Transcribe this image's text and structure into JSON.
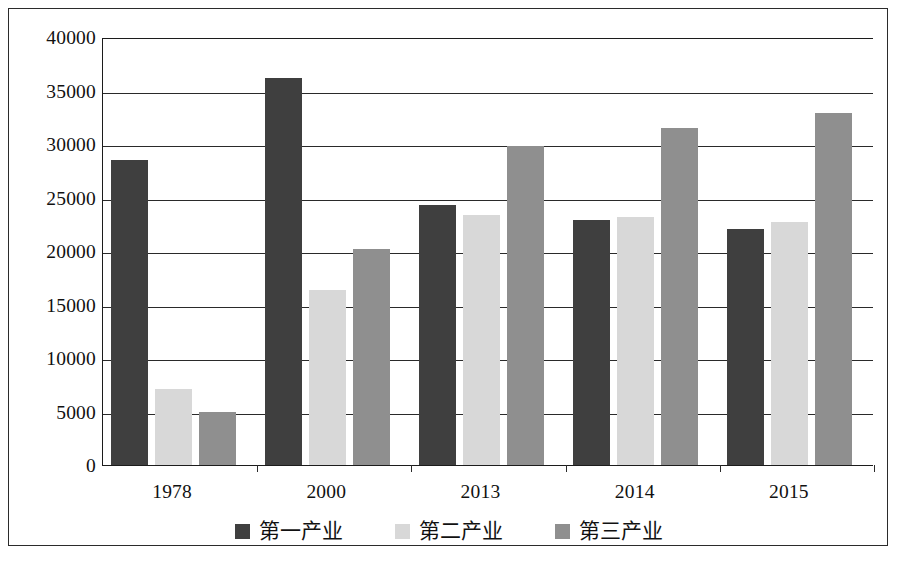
{
  "chart_data": {
    "type": "bar",
    "title": "",
    "subtitle": "",
    "xlabel": "",
    "ylabel": "",
    "categories": [
      "1978",
      "2000",
      "2013",
      "2014",
      "2015"
    ],
    "series": [
      {
        "name": "第一产业",
        "color": "#3f3f3f",
        "values": [
          28500,
          36200,
          24300,
          22900,
          22100
        ]
      },
      {
        "name": "第二产业",
        "color": "#d8d8d8",
        "values": [
          7150,
          16400,
          23400,
          23200,
          22700
        ]
      },
      {
        "name": "第三产业",
        "color": "#8f8f8f",
        "values": [
          5000,
          20200,
          29800,
          31500,
          32900
        ]
      }
    ],
    "ylim": [
      0,
      40000
    ],
    "ytick_values": [
      0,
      5000,
      10000,
      15000,
      20000,
      25000,
      30000,
      35000,
      40000
    ],
    "ytick_labels": [
      "0",
      "5000",
      "10000",
      "15000",
      "20000",
      "25000",
      "30000",
      "35000",
      "40000"
    ],
    "grid": true,
    "grid_axis": "y",
    "legend_position": "bottom",
    "legend": [
      "第一产业",
      "第二产业",
      "第三产业"
    ]
  },
  "figure": {
    "border_color": "#2b2b2b",
    "background": "#ffffff",
    "axis_color": "#1c1c1c"
  }
}
